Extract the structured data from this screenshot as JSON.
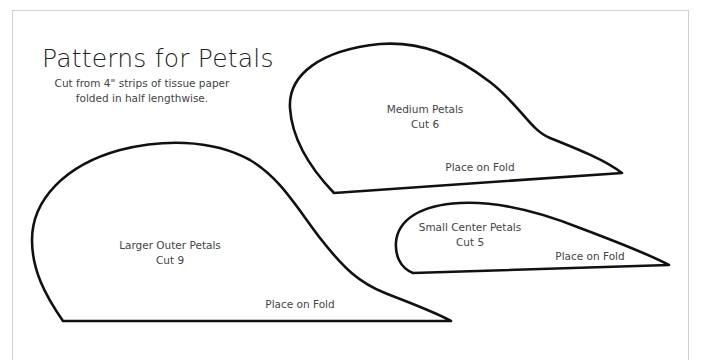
{
  "document": {
    "title": "Patterns for Petals",
    "subtitle_lines": [
      "Cut from 4\" strips of tissue paper",
      "folded in half lengthwise."
    ]
  },
  "patterns": [
    {
      "id": "medium",
      "name": "Medium Petals",
      "cut": "Cut 6",
      "fold_label": "Place on Fold"
    },
    {
      "id": "large",
      "name": "Larger Outer Petals",
      "cut": "Cut 9",
      "fold_label": "Place on Fold"
    },
    {
      "id": "small",
      "name": "Small Center Petals",
      "cut": "Cut 5",
      "fold_label": "Place on Fold"
    }
  ],
  "colors": {
    "outline": "#111111",
    "text": "#444444",
    "frame": "#cfcfcf"
  }
}
